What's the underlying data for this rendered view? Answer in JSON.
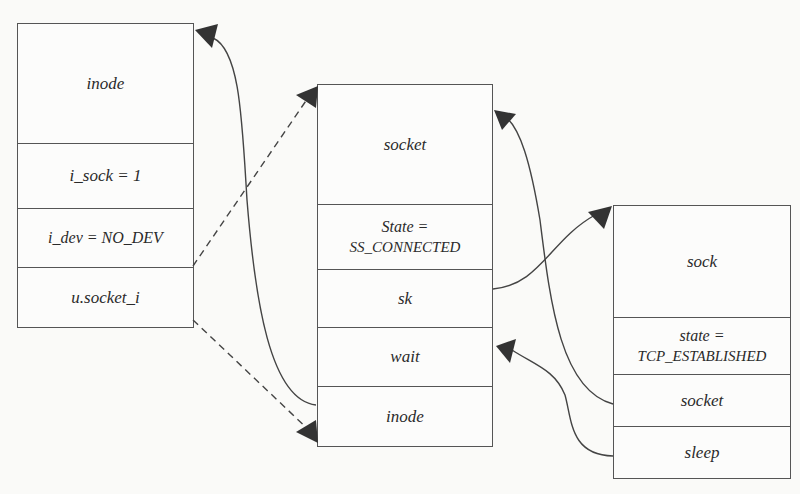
{
  "diagram": {
    "structures": [
      {
        "id": "inode",
        "cells": [
          {
            "label": "inode"
          },
          {
            "label": "i_sock = 1"
          },
          {
            "label": "i_dev = NO_DEV"
          },
          {
            "label": "u.socket_i"
          }
        ]
      },
      {
        "id": "socket",
        "cells": [
          {
            "label": "socket"
          },
          {
            "label_line1": "State =",
            "label_line2": "SS_CONNECTED"
          },
          {
            "label": "sk"
          },
          {
            "label": "wait"
          },
          {
            "label": "inode"
          }
        ]
      },
      {
        "id": "sock",
        "cells": [
          {
            "label": "sock"
          },
          {
            "label_line1": "state =",
            "label_line2": "TCP_ESTABLISHED"
          },
          {
            "label": "socket"
          },
          {
            "label": "sleep"
          }
        ]
      }
    ],
    "links": [
      {
        "from": "inode.u.socket_i",
        "to": "socket (top)",
        "style": "dashed"
      },
      {
        "from": "inode.u.socket_i",
        "to": "socket.inode",
        "style": "dashed"
      },
      {
        "from": "socket.inode",
        "to": "inode (top)",
        "style": "solid"
      },
      {
        "from": "socket.sk",
        "to": "sock (top)",
        "style": "solid"
      },
      {
        "from": "sock.socket",
        "to": "socket (top)",
        "style": "solid"
      },
      {
        "from": "sock.sleep",
        "to": "socket.wait",
        "style": "solid"
      }
    ],
    "colors": {
      "line": "#444444",
      "arrowhead": "#333333",
      "border": "#555555",
      "background": "#fafaf8"
    }
  }
}
